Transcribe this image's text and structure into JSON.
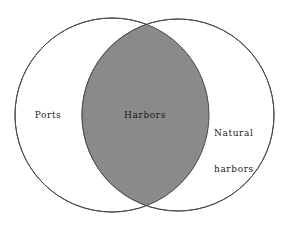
{
  "diagram": {
    "type": "venn-2-set",
    "title": "",
    "background_color": "#ffffff",
    "canvas": {
      "width": 288,
      "height": 226
    },
    "stroke_color": "#4a4a4a",
    "stroke_width": 1,
    "intersection_fill": "#8a8a8a",
    "circle_fill": "#ffffff",
    "text_color": "#1c1c1c",
    "sets": [
      {
        "id": "ports",
        "label": "Ports",
        "position": "left",
        "fill": "#ffffff",
        "center_x": 112,
        "center_y": 115,
        "radius": 97
      },
      {
        "id": "natural-harbors",
        "label_line_1": "Natural",
        "label_line_2": "harbors",
        "position": "right",
        "fill": "#ffffff",
        "center_x": 178,
        "center_y": 115,
        "radius": 96
      }
    ],
    "intersection": {
      "id": "harbors",
      "label": "Harbors",
      "fill": "#8a8a8a",
      "center_x": 145,
      "center_y": 115
    }
  }
}
